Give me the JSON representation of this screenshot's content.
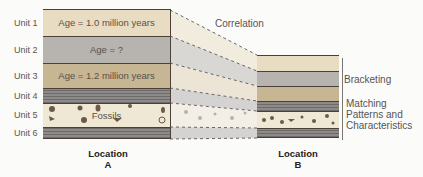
{
  "location_a": {
    "label": "Location",
    "letter": "A",
    "units": [
      {
        "name": "Unit 1",
        "text": "Age = 1.0 million years",
        "color": "#e8ddc2"
      },
      {
        "name": "Unit 2",
        "text": "Age = ?",
        "color": "#b7b3ae"
      },
      {
        "name": "Unit 3",
        "text": "Age = 1.2 million years",
        "color": "#c7b694"
      },
      {
        "name": "Unit 4",
        "text": "",
        "color": "#8d8a8a"
      },
      {
        "name": "Unit 5",
        "text": "Fossils",
        "color": "#efe8d5"
      },
      {
        "name": "Unit 6",
        "text": "",
        "color": "#8d8a8a"
      }
    ]
  },
  "location_b": {
    "label": "Location",
    "letter": "B"
  },
  "annotations": {
    "correlation": "Correlation",
    "bracketing": "Bracketing",
    "matching_line1": "Matching",
    "matching_line2": "Patterns and",
    "matching_line3": "Characteristics"
  }
}
